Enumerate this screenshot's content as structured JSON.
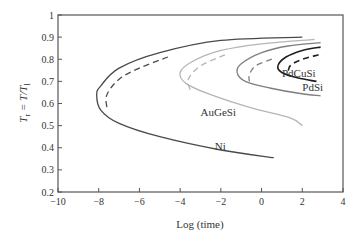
{
  "chart_data": {
    "type": "line",
    "title": "",
    "xlabel": "Log (time)",
    "ylabel": "T_r = T/T_l",
    "ylabel_parts": {
      "main": "T",
      "sub": "r",
      "eq": " = T/T",
      "sub2": "l"
    },
    "xlim": [
      -10,
      4
    ],
    "ylim": [
      0.2,
      1
    ],
    "xticks": [
      -10,
      -8,
      -6,
      -4,
      -2,
      0,
      2,
      4
    ],
    "xtick_labels": [
      "−10",
      "−8",
      "−6",
      "−4",
      "−2",
      "0",
      "2",
      "4"
    ],
    "yticks": [
      0.2,
      0.3,
      0.4,
      0.5,
      0.6,
      0.7,
      0.8,
      0.9,
      1
    ],
    "ytick_labels": [
      "0.2",
      "0.3",
      "0.4",
      "0.5",
      "0.6",
      "0.7",
      "0.8",
      "0.9",
      "1"
    ],
    "grid": false,
    "legend": "inline labels",
    "series": [
      {
        "name": "Ni",
        "color": "#4a4a4a",
        "style": "solid",
        "points": [
          [
            2.0,
            0.9
          ],
          [
            -2,
            0.885
          ],
          [
            -5,
            0.83
          ],
          [
            -7,
            0.76
          ],
          [
            -7.9,
            0.68
          ],
          [
            -8.1,
            0.64
          ],
          [
            -7.9,
            0.57
          ],
          [
            -7,
            0.51
          ],
          [
            -5,
            0.45
          ],
          [
            -2,
            0.39
          ],
          [
            0.6,
            0.355
          ]
        ]
      },
      {
        "name": "Ni (dashed)",
        "color": "#4a4a4a",
        "style": "dashed",
        "points": [
          [
            -4.6,
            0.81
          ],
          [
            -6,
            0.76
          ],
          [
            -7,
            0.71
          ],
          [
            -7.6,
            0.64
          ],
          [
            -7.6,
            0.58
          ]
        ]
      },
      {
        "name": "AuGeSi",
        "color": "#b5b5b5",
        "style": "solid",
        "points": [
          [
            2.6,
            0.89
          ],
          [
            0,
            0.87
          ],
          [
            -2,
            0.84
          ],
          [
            -3.4,
            0.79
          ],
          [
            -4.0,
            0.74
          ],
          [
            -3.7,
            0.69
          ],
          [
            -2.5,
            0.64
          ],
          [
            -0.5,
            0.58
          ],
          [
            1.4,
            0.535
          ],
          [
            2.0,
            0.5
          ]
        ]
      },
      {
        "name": "AuGeSi (dashed)",
        "color": "#b5b5b5",
        "style": "dashed",
        "points": [
          [
            -1.8,
            0.82
          ],
          [
            -3.0,
            0.77
          ],
          [
            -3.6,
            0.71
          ],
          [
            -3.5,
            0.66
          ]
        ]
      },
      {
        "name": "PdSi",
        "color": "#7f7f7f",
        "style": "solid",
        "points": [
          [
            2.9,
            0.875
          ],
          [
            1.3,
            0.86
          ],
          [
            0,
            0.83
          ],
          [
            -1.0,
            0.78
          ],
          [
            -1.2,
            0.74
          ],
          [
            -0.8,
            0.7
          ],
          [
            0.4,
            0.67
          ],
          [
            1.9,
            0.645
          ],
          [
            2.9,
            0.635
          ]
        ]
      },
      {
        "name": "PdSi (dashed)",
        "color": "#7f7f7f",
        "style": "dashed",
        "points": [
          [
            0.5,
            0.8
          ],
          [
            -0.3,
            0.77
          ],
          [
            -0.6,
            0.73
          ],
          [
            -0.6,
            0.7
          ]
        ]
      },
      {
        "name": "PdCuSi",
        "color": "#1f1f1f",
        "style": "solid",
        "points": [
          [
            2.9,
            0.855
          ],
          [
            2.0,
            0.84
          ],
          [
            1.2,
            0.81
          ],
          [
            0.8,
            0.77
          ],
          [
            1.0,
            0.74
          ],
          [
            1.8,
            0.715
          ],
          [
            2.7,
            0.7
          ]
        ]
      },
      {
        "name": "PdCuSi (dashed)",
        "color": "#1f1f1f",
        "style": "dashed",
        "points": [
          [
            2.8,
            0.82
          ],
          [
            2.0,
            0.8
          ],
          [
            1.4,
            0.77
          ],
          [
            1.3,
            0.73
          ]
        ]
      }
    ],
    "annotations": [
      {
        "text": "Ni",
        "x": -2.3,
        "y": 0.39
      },
      {
        "text": "AuGeSi",
        "x": -3.0,
        "y": 0.545
      },
      {
        "text": "PdSi",
        "x": 2.0,
        "y": 0.655
      },
      {
        "text": "PdCuSi",
        "x": 1.0,
        "y": 0.72
      }
    ]
  }
}
